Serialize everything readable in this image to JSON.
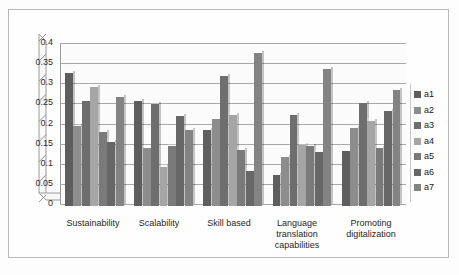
{
  "chart_data": {
    "type": "bar",
    "title": "",
    "subtitle": "",
    "xlabel": "",
    "ylabel": "",
    "ylim": [
      0,
      0.4
    ],
    "ytick_labels": [
      "0.4",
      "0.35",
      "0.3",
      "0.25",
      "0.2",
      "0.15",
      "0.1",
      "0.05",
      "0"
    ],
    "ytick_values": [
      0.4,
      0.35,
      0.3,
      0.25,
      0.2,
      0.15,
      0.1,
      0.05,
      0
    ],
    "grid": true,
    "legend_position": "right",
    "style": "3d-clustered-column-grayscale",
    "categories": [
      "Sustainability",
      "Scalability",
      "Skill based",
      "Language translation capabilities",
      "Promoting digitalization"
    ],
    "series": [
      {
        "name": "a1",
        "color": "#5e5e5e",
        "values": [
          0.33,
          0.26,
          0.19,
          0.077,
          0.136
        ]
      },
      {
        "name": "a2",
        "color": "#8d8d8d",
        "values": [
          0.2,
          0.143,
          0.215,
          0.122,
          0.195
        ]
      },
      {
        "name": "a3",
        "color": "#6e6e6e",
        "values": [
          0.26,
          0.253,
          0.323,
          0.225,
          0.255
        ]
      },
      {
        "name": "a4",
        "color": "#a5a5a5",
        "values": [
          0.295,
          0.098,
          0.225,
          0.152,
          0.21
        ]
      },
      {
        "name": "a5",
        "color": "#7a7a7a",
        "values": [
          0.185,
          0.15,
          0.14,
          0.148,
          0.145
        ]
      },
      {
        "name": "a6",
        "color": "#676767",
        "values": [
          0.158,
          0.223,
          0.088,
          0.135,
          0.235
        ]
      },
      {
        "name": "a7",
        "color": "#838383",
        "values": [
          0.27,
          0.19,
          0.38,
          0.34,
          0.288
        ]
      }
    ]
  },
  "legend": {
    "items": [
      {
        "label": "a1"
      },
      {
        "label": "a2"
      },
      {
        "label": "a3"
      },
      {
        "label": "a4"
      },
      {
        "label": "a5"
      },
      {
        "label": "a6"
      },
      {
        "label": "a7"
      }
    ]
  },
  "colors": {
    "plot_background": "#fbfbfb",
    "gridline": "#a9a9a9",
    "axis": "#8d8d8d",
    "frame": "#b8b8b8",
    "page_background": "#ffffff",
    "text": "#1f1f1f"
  }
}
